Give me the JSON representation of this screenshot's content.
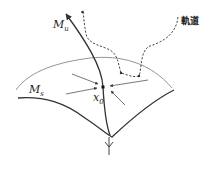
{
  "diagram": {
    "labels": {
      "unstable_manifold": "M",
      "unstable_sub": "u",
      "stable_manifold": "M",
      "stable_sub": "s",
      "fixed_point": "x",
      "fixed_point_sub": "0",
      "trajectory": "軌道"
    },
    "colors": {
      "stroke": "#333333",
      "light_stroke": "#888888",
      "background": "#ffffff"
    }
  }
}
